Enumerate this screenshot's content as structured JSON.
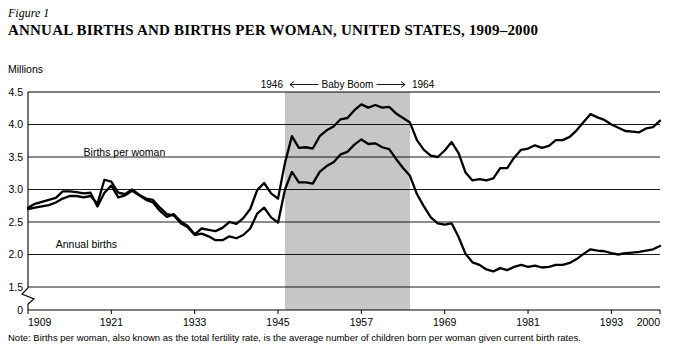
{
  "figure": {
    "label": "Figure 1",
    "title_part1": "A",
    "title_part2": "NNUAL ",
    "title_full": "ANNUAL BIRTHS AND BIRTHS PER WOMAN, UNITED STATES, 1909–2000",
    "units": "Millions",
    "note": "Note: Births per woman, also known as the total fertility rate, is the average number of children born per woman given current birth rates."
  },
  "chart_data": {
    "type": "line",
    "title": "ANNUAL BIRTHS AND BIRTHS PER WOMAN, UNITED STATES, 1909–2000",
    "xlabel": "",
    "ylabel": "Millions",
    "ylim": [
      0,
      4.5
    ],
    "yticks": [
      "0",
      "1.5",
      "2.0",
      "2.5",
      "3.0",
      "3.5",
      "4.0",
      "4.5"
    ],
    "ytick_values": [
      0,
      1.5,
      2.0,
      2.5,
      3.0,
      3.5,
      4.0,
      4.5
    ],
    "axis_break": true,
    "xticks": [
      "1909",
      "1921",
      "1933",
      "1945",
      "1957",
      "1969",
      "1981",
      "1993",
      "2000"
    ],
    "xtick_values": [
      1909,
      1921,
      1933,
      1945,
      1957,
      1969,
      1981,
      1993,
      2000
    ],
    "xlim": [
      1909,
      2000
    ],
    "grid": "horizontal",
    "legend": "inline-labels",
    "annotations": [
      {
        "text": "1946",
        "x": 1946
      },
      {
        "text": "Baby Boom",
        "x": 1955
      },
      {
        "text": "1964",
        "x": 1964
      }
    ],
    "shaded_region": {
      "label": "Baby Boom",
      "x_start": 1946,
      "x_end": 1964,
      "color": "#c6c6c6"
    },
    "series": [
      {
        "name": "Births per woman",
        "label_x": 1917,
        "label_y": 3.52,
        "x": [
          1909,
          1910,
          1911,
          1912,
          1913,
          1914,
          1915,
          1916,
          1917,
          1918,
          1919,
          1920,
          1921,
          1922,
          1923,
          1924,
          1925,
          1926,
          1927,
          1928,
          1929,
          1930,
          1931,
          1932,
          1933,
          1934,
          1935,
          1936,
          1937,
          1938,
          1939,
          1940,
          1941,
          1942,
          1943,
          1944,
          1945,
          1946,
          1947,
          1948,
          1949,
          1950,
          1951,
          1952,
          1953,
          1954,
          1955,
          1956,
          1957,
          1958,
          1959,
          1960,
          1961,
          1962,
          1963,
          1964,
          1965,
          1966,
          1967,
          1968,
          1969,
          1970,
          1971,
          1972,
          1973,
          1974,
          1975,
          1976,
          1977,
          1978,
          1979,
          1980,
          1981,
          1982,
          1983,
          1984,
          1985,
          1986,
          1987,
          1988,
          1989,
          1990,
          1991,
          1992,
          1993,
          1994,
          1995,
          1996,
          1997,
          1998,
          1999,
          2000
        ],
        "y": [
          2.7,
          2.72,
          2.74,
          2.76,
          2.8,
          2.86,
          2.9,
          2.9,
          2.88,
          2.9,
          2.78,
          3.15,
          3.12,
          2.95,
          2.93,
          3.0,
          2.92,
          2.86,
          2.84,
          2.72,
          2.62,
          2.6,
          2.48,
          2.42,
          2.3,
          2.32,
          2.28,
          2.22,
          2.22,
          2.28,
          2.25,
          2.3,
          2.4,
          2.63,
          2.72,
          2.57,
          2.49,
          3.0,
          3.27,
          3.11,
          3.11,
          3.09,
          3.27,
          3.36,
          3.42,
          3.54,
          3.58,
          3.69,
          3.77,
          3.7,
          3.71,
          3.65,
          3.62,
          3.47,
          3.33,
          3.21,
          2.93,
          2.74,
          2.57,
          2.48,
          2.46,
          2.48,
          2.27,
          2.01,
          1.88,
          1.84,
          1.77,
          1.74,
          1.79,
          1.76,
          1.81,
          1.84,
          1.81,
          1.83,
          1.8,
          1.81,
          1.84,
          1.84,
          1.87,
          1.93,
          2.01,
          2.08,
          2.06,
          2.05,
          2.02,
          2.0,
          2.02,
          2.03,
          2.04,
          2.06,
          2.08,
          2.13
        ]
      },
      {
        "name": "Annual births",
        "label_x": 1913,
        "label_y": 2.1,
        "x": [
          1909,
          1910,
          1911,
          1912,
          1913,
          1914,
          1915,
          1916,
          1917,
          1918,
          1919,
          1920,
          1921,
          1922,
          1923,
          1924,
          1925,
          1926,
          1927,
          1928,
          1929,
          1930,
          1931,
          1932,
          1933,
          1934,
          1935,
          1936,
          1937,
          1938,
          1939,
          1940,
          1941,
          1942,
          1943,
          1944,
          1945,
          1946,
          1947,
          1948,
          1949,
          1950,
          1951,
          1952,
          1953,
          1954,
          1955,
          1956,
          1957,
          1958,
          1959,
          1960,
          1961,
          1962,
          1963,
          1964,
          1965,
          1966,
          1967,
          1968,
          1969,
          1970,
          1971,
          1972,
          1973,
          1974,
          1975,
          1976,
          1977,
          1978,
          1979,
          1980,
          1981,
          1982,
          1983,
          1984,
          1985,
          1986,
          1987,
          1988,
          1989,
          1990,
          1991,
          1992,
          1993,
          1994,
          1995,
          1996,
          1997,
          1998,
          1999,
          2000
        ],
        "y": [
          2.72,
          2.78,
          2.81,
          2.84,
          2.87,
          2.97,
          2.97,
          2.96,
          2.94,
          2.95,
          2.74,
          2.95,
          3.06,
          2.88,
          2.91,
          2.98,
          2.91,
          2.84,
          2.8,
          2.67,
          2.58,
          2.62,
          2.51,
          2.44,
          2.31,
          2.4,
          2.38,
          2.36,
          2.41,
          2.5,
          2.47,
          2.56,
          2.7,
          2.99,
          3.1,
          2.94,
          2.86,
          3.41,
          3.82,
          3.64,
          3.65,
          3.63,
          3.82,
          3.91,
          3.97,
          4.08,
          4.1,
          4.22,
          4.31,
          4.26,
          4.3,
          4.26,
          4.27,
          4.17,
          4.1,
          4.03,
          3.76,
          3.61,
          3.52,
          3.5,
          3.6,
          3.73,
          3.56,
          3.26,
          3.14,
          3.16,
          3.14,
          3.17,
          3.33,
          3.33,
          3.49,
          3.61,
          3.63,
          3.68,
          3.64,
          3.67,
          3.76,
          3.76,
          3.81,
          3.91,
          4.04,
          4.16,
          4.11,
          4.07,
          4.0,
          3.95,
          3.9,
          3.89,
          3.88,
          3.94,
          3.96,
          4.06
        ]
      }
    ]
  }
}
